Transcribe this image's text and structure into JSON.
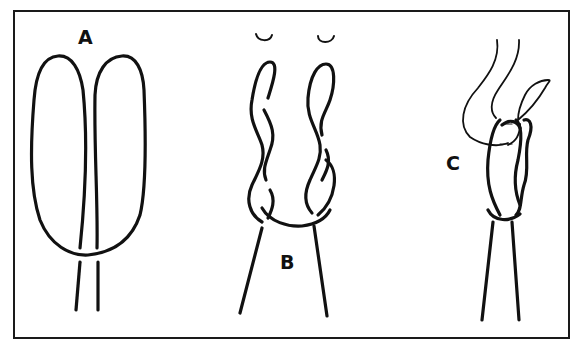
{
  "figure": {
    "panels": [
      {
        "label": "A",
        "description": "two parallel elongated loops"
      },
      {
        "label": "B",
        "description": "each loop twisted, with rotation arrows"
      },
      {
        "label": "C",
        "description": "twisted loops passed over hook"
      }
    ],
    "colors": {
      "line": "#111111",
      "background": "#ffffff"
    }
  }
}
